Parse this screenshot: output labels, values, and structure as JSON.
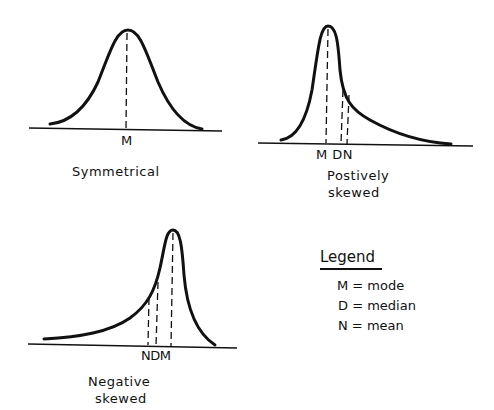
{
  "diagram": {
    "panels": [
      {
        "id": "symmetrical",
        "title_lines": [
          "Symmetrical"
        ],
        "marker_labels": "M",
        "markers": [
          {
            "symbol": "M",
            "meaning": "mode/median/mean coincide"
          }
        ]
      },
      {
        "id": "positive",
        "title_lines": [
          "Postively",
          "skewed"
        ],
        "marker_labels": "M DN",
        "markers": [
          {
            "symbol": "M",
            "meaning": "mode"
          },
          {
            "symbol": "D",
            "meaning": "median"
          },
          {
            "symbol": "N",
            "meaning": "mean"
          }
        ]
      },
      {
        "id": "negative",
        "title_lines": [
          "Negative",
          "skewed"
        ],
        "marker_labels": "NDM",
        "markers": [
          {
            "symbol": "N",
            "meaning": "mean"
          },
          {
            "symbol": "D",
            "meaning": "median"
          },
          {
            "symbol": "M",
            "meaning": "mode"
          }
        ]
      }
    ],
    "legend": {
      "title": "Legend",
      "items": [
        {
          "text": "M = mode"
        },
        {
          "text": "D = median"
        },
        {
          "text": "N = mean"
        }
      ]
    },
    "colors": {
      "ink": "#111111",
      "background": "#ffffff"
    }
  }
}
